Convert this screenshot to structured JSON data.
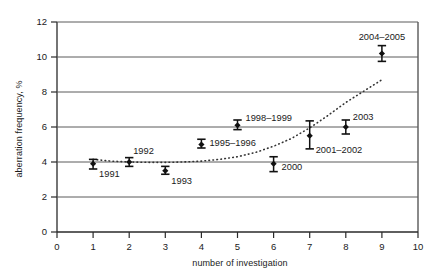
{
  "chart_data": {
    "type": "scatter",
    "title": "",
    "xlabel": "number of investigation",
    "ylabel": "aberration frequency, %",
    "xlim": [
      0,
      10
    ],
    "ylim": [
      0,
      12
    ],
    "xticks": [
      "0",
      "1",
      "2",
      "3",
      "4",
      "5",
      "6",
      "7",
      "8",
      "9",
      "10"
    ],
    "yticks": [
      "0",
      "2",
      "4",
      "6",
      "8",
      "10",
      "12"
    ],
    "grid": "horizontal",
    "legend": "none",
    "marker": "filled-diamond-with-error-bars",
    "series": [
      {
        "name": "aberration frequency",
        "x": [
          1,
          2,
          3,
          4,
          5,
          6,
          7,
          8,
          9
        ],
        "values": [
          3.9,
          4.0,
          3.5,
          5.0,
          6.1,
          3.9,
          5.5,
          6.0,
          10.2
        ],
        "err_low": [
          3.6,
          3.75,
          3.3,
          4.8,
          5.85,
          3.45,
          4.75,
          5.6,
          9.75
        ],
        "err_high": [
          4.15,
          4.25,
          3.75,
          5.3,
          6.4,
          4.3,
          6.35,
          6.4,
          10.65
        ],
        "point_labels": [
          "1991",
          "1992",
          "1993",
          "1995–1996",
          "1998–1999",
          "2000",
          "2001–2002",
          "2003",
          "2004–2005"
        ]
      }
    ],
    "trendline": {
      "name": "fitted trend",
      "style": "dotted",
      "x": [
        1.0,
        1.5,
        2.0,
        2.5,
        3.0,
        3.5,
        4.0,
        4.5,
        5.0,
        5.5,
        6.0,
        6.5,
        7.0,
        7.5,
        8.0,
        8.5,
        9.0
      ],
      "y": [
        4.15,
        4.05,
        4.0,
        3.98,
        3.98,
        4.0,
        4.05,
        4.15,
        4.3,
        4.55,
        4.9,
        5.35,
        5.95,
        6.65,
        7.4,
        8.05,
        8.7
      ]
    }
  },
  "annotations": {
    "labels": [
      {
        "text": "1991",
        "x": 1,
        "y": 3.9
      },
      {
        "text": "1992",
        "x": 2,
        "y": 4.0
      },
      {
        "text": "1993",
        "x": 3,
        "y": 3.5
      },
      {
        "text": "1995–1996",
        "x": 4,
        "y": 5.0
      },
      {
        "text": "1998–1999",
        "x": 5,
        "y": 6.1
      },
      {
        "text": "2000",
        "x": 6,
        "y": 3.9
      },
      {
        "text": "2001–2002",
        "x": 7,
        "y": 5.5
      },
      {
        "text": "2003",
        "x": 8,
        "y": 6.0
      },
      {
        "text": "2004–2005",
        "x": 9,
        "y": 10.2
      }
    ]
  },
  "colors": {
    "ink": "#1a1a1a",
    "gridline": "#5a5a5a",
    "axis": "#2a2a2a",
    "marker": "#111111",
    "trend": "#333333",
    "background": "#ffffff"
  }
}
